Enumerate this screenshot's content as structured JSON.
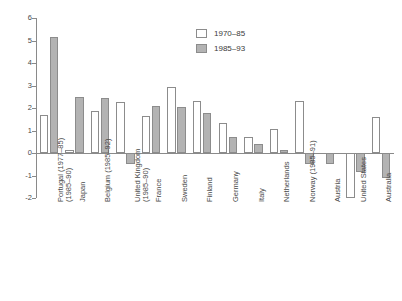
{
  "chart_data": {
    "type": "bar",
    "title": "",
    "subtitle": "",
    "xlabel": "",
    "ylabel": "",
    "ylim": [
      -2,
      6
    ],
    "yticks": [
      -2,
      -1,
      0,
      1,
      2,
      3,
      4,
      5,
      6
    ],
    "ytick_labels": [
      "-2",
      "-1",
      "0",
      "1",
      "2",
      "3",
      "4",
      "5",
      "6"
    ],
    "grid": false,
    "legend_position": "top-center",
    "categories": [
      "Portugal (1977–85)\n(1985–90)",
      "Japan",
      "Belgium (1985–92)",
      "United Kingdom\n(1985–90)",
      "France",
      "Sweden",
      "Finland",
      "Germany",
      "Italy",
      "Netherlands",
      "Norway (1985–91)",
      "Austria",
      "United States",
      "Australia"
    ],
    "series": [
      {
        "name": "1970–85",
        "color": "#ffffff",
        "values": [
          1.7,
          0.15,
          1.85,
          2.25,
          1.65,
          2.95,
          2.3,
          1.35,
          0.7,
          1.05,
          2.3,
          null,
          -2.0,
          1.6
        ]
      },
      {
        "name": "1985–93",
        "color": "#b3b3b3",
        "values": [
          5.15,
          2.5,
          2.45,
          -0.5,
          2.1,
          2.05,
          1.8,
          0.7,
          0.4,
          0.15,
          -0.5,
          -0.5,
          -0.85,
          -1.1
        ]
      }
    ],
    "axis_color": "#8a8a8a",
    "bar_border_color": "#8c8c8c"
  }
}
